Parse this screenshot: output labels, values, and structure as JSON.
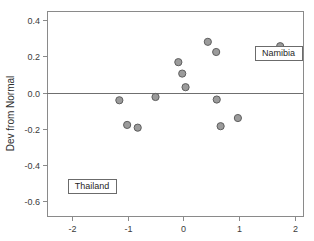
{
  "chart_data": {
    "type": "scatter",
    "title": "",
    "xlabel": "",
    "ylabel": "Dev from Normal",
    "xlim": [
      -2.45,
      2.15
    ],
    "ylim": [
      -0.68,
      0.45
    ],
    "xticks": [
      -2,
      -1,
      0,
      1,
      2
    ],
    "xtick_labels": [
      "-2",
      "-1",
      "0",
      "1",
      "2"
    ],
    "yticks": [
      0.4,
      0.2,
      0.0,
      -0.2,
      -0.4,
      -0.6
    ],
    "ytick_labels": [
      "0.4",
      "0.2",
      "0.0",
      "-0.2",
      "-0.4",
      "-0.6"
    ],
    "grid": false,
    "legend": "none",
    "zero_reference_line": 0.0,
    "marker_fill": "#9b9b9b",
    "marker_edge": "#5e5e5e",
    "points": [
      {
        "x": -1.99,
        "y": -0.525,
        "label": "Thailand"
      },
      {
        "x": -1.15,
        "y": -0.042,
        "label": ""
      },
      {
        "x": -1.01,
        "y": -0.178,
        "label": ""
      },
      {
        "x": -0.82,
        "y": -0.193,
        "label": ""
      },
      {
        "x": -0.5,
        "y": -0.024,
        "label": ""
      },
      {
        "x": -0.09,
        "y": 0.168,
        "label": ""
      },
      {
        "x": -0.02,
        "y": 0.105,
        "label": ""
      },
      {
        "x": 0.04,
        "y": 0.03,
        "label": ""
      },
      {
        "x": 0.44,
        "y": 0.28,
        "label": ""
      },
      {
        "x": 0.59,
        "y": 0.224,
        "label": ""
      },
      {
        "x": 0.6,
        "y": -0.038,
        "label": ""
      },
      {
        "x": 0.67,
        "y": -0.185,
        "label": ""
      },
      {
        "x": 0.98,
        "y": -0.14,
        "label": ""
      },
      {
        "x": 1.74,
        "y": 0.256,
        "label": "Namibia"
      }
    ],
    "annotations": [
      {
        "name": "Thailand",
        "text": "Thailand",
        "point_x": -1.99,
        "point_y": -0.525,
        "box_x": 68,
        "box_y": 179,
        "box_w": 48,
        "box_h": 14
      },
      {
        "name": "Namibia",
        "text": "Namibia",
        "point_x": 1.74,
        "point_y": 0.256,
        "box_x": 255,
        "box_y": 46,
        "box_w": 47,
        "box_h": 14
      }
    ]
  },
  "plot_frame": {
    "left": 47,
    "right": 303,
    "top": 11,
    "bottom": 216
  }
}
